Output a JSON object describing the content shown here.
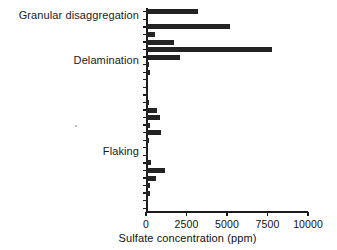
{
  "chart": {
    "type": "bar",
    "orientation": "horizontal",
    "background_color": "#ffffff",
    "bar_color": "#232323",
    "axis_color": "#1a1a1a"
  },
  "axes": {
    "x_title": "Sulfate concentration (ppm)",
    "x_ticks": [
      "0",
      "2500",
      "5000",
      "7500",
      "10000"
    ],
    "x_tick_values": [
      0,
      2500,
      5000,
      7500,
      10000
    ],
    "x_min": 0,
    "x_max": 10000,
    "y_title": "",
    "y_category_labels": [
      {
        "label": "Granular disaggregation",
        "index": 0
      },
      {
        "label": "Delamination",
        "index": 6
      },
      {
        "label": "Flaking",
        "index": 18
      }
    ],
    "grid": "off",
    "legend": "none"
  },
  "chart_data": {
    "type": "bar",
    "title": "",
    "xlabel": "Sulfate concentration (ppm)",
    "ylabel": "",
    "xlim": [
      0,
      10000
    ],
    "grid": false,
    "legend": null,
    "orientation": "horizontal",
    "categories": [
      "Granular disaggregation",
      "sample-2",
      "sample-3",
      "sample-4",
      "sample-5",
      "sample-6",
      "Delamination",
      "sample-8",
      "sample-9",
      "sample-10",
      "sample-11",
      "sample-12",
      "sample-13",
      "sample-14",
      "sample-15",
      "sample-16",
      "sample-17",
      "sample-18",
      "Flaking",
      "sample-20",
      "sample-21",
      "sample-22",
      "sample-23",
      "sample-24",
      "sample-25",
      "sample-26",
      "sample-27"
    ],
    "values": [
      3200,
      0,
      5200,
      550,
      1750,
      7750,
      2100,
      200,
      250,
      60,
      0,
      130,
      200,
      700,
      850,
      250,
      900,
      170,
      60,
      130,
      330,
      1200,
      620,
      260,
      250,
      60,
      0
    ],
    "values_note": "Bar lengths read against the 0–10000 ppm axis; short bars estimated from pixel extents."
  }
}
